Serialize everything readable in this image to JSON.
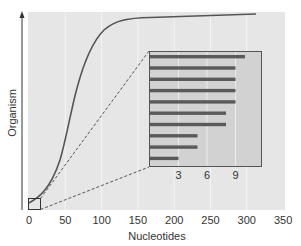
{
  "chart_data": {
    "type": "line",
    "title": "",
    "xlabel": "Nucleotides",
    "ylabel": "Organism",
    "xlim": [
      0,
      350
    ],
    "xticks": [
      0,
      50,
      100,
      150,
      200,
      250,
      300,
      350
    ],
    "grid": "vertical",
    "series": [
      {
        "name": "curve",
        "x": [
          0,
          15,
          35,
          45,
          60,
          75,
          85,
          100,
          120,
          150,
          200,
          250,
          313
        ],
        "y_px": [
          203,
          195,
          170,
          150,
          100,
          55,
          38,
          24,
          19,
          18,
          17,
          16,
          14
        ]
      }
    ],
    "zoom_box": {
      "x_range": [
        0,
        17
      ]
    },
    "inset": {
      "type": "bar",
      "orientation": "horizontal",
      "xticks": [
        3,
        6,
        9
      ],
      "values": [
        10,
        9,
        9,
        9,
        9,
        8,
        8,
        5,
        5,
        3
      ]
    }
  },
  "labels": {
    "xlabel": "Nucleotides",
    "ylabel": "Organism",
    "xticks": [
      "0",
      "50",
      "100",
      "150",
      "200",
      "250",
      "300",
      "350"
    ],
    "inset_ticks": [
      "3",
      "6",
      "9"
    ]
  },
  "colors": {
    "plot_bg": "#e6e6e6",
    "inset_bg": "#d2d2d2",
    "bar": "#5a5a5a",
    "curve": "#555555",
    "grid": "#f4f4f4"
  }
}
